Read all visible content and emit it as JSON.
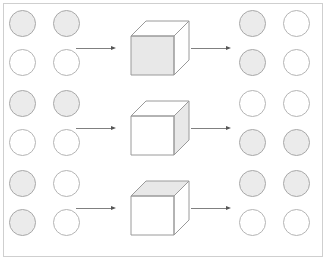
{
  "figure": {
    "type": "diagram",
    "canvas": {
      "width": 327,
      "height": 261,
      "background": "#ffffff"
    },
    "frame": {
      "border_color": "#cfcfcf",
      "border_width": 1
    },
    "colors": {
      "circle_outline": "#b4b4b4",
      "circle_shaded_fill": "#ebebeb",
      "circle_empty_fill": "#ffffff",
      "cube_edge": "#9a9a9a",
      "cube_shaded_face": "#e8e8e8",
      "cube_plain_face": "#ffffff",
      "arrow": "#808080"
    },
    "rows": [
      {
        "index": 1,
        "left_pattern_name": "top-row-shaded",
        "left_circles": [
          {
            "row": 0,
            "col": 0,
            "state": "shaded"
          },
          {
            "row": 0,
            "col": 1,
            "state": "shaded"
          },
          {
            "row": 1,
            "col": 0,
            "state": "empty"
          },
          {
            "row": 1,
            "col": 1,
            "state": "empty"
          }
        ],
        "cube": {
          "shaded_face": "front",
          "front_state": "shaded",
          "top_state": "plain",
          "side_state": "plain"
        },
        "right_pattern_name": "left-column-shaded",
        "right_circles": [
          {
            "row": 0,
            "col": 0,
            "state": "shaded"
          },
          {
            "row": 0,
            "col": 1,
            "state": "empty"
          },
          {
            "row": 1,
            "col": 0,
            "state": "shaded"
          },
          {
            "row": 1,
            "col": 1,
            "state": "empty"
          }
        ],
        "arrow_left": "arrow-right-icon",
        "arrow_right": "arrow-right-icon"
      },
      {
        "index": 2,
        "left_pattern_name": "top-row-shaded",
        "left_circles": [
          {
            "row": 0,
            "col": 0,
            "state": "shaded"
          },
          {
            "row": 0,
            "col": 1,
            "state": "shaded"
          },
          {
            "row": 1,
            "col": 0,
            "state": "empty"
          },
          {
            "row": 1,
            "col": 1,
            "state": "empty"
          }
        ],
        "cube": {
          "shaded_face": "side",
          "front_state": "plain",
          "top_state": "plain",
          "side_state": "shaded"
        },
        "right_pattern_name": "bottom-row-shaded",
        "right_circles": [
          {
            "row": 0,
            "col": 0,
            "state": "empty"
          },
          {
            "row": 0,
            "col": 1,
            "state": "empty"
          },
          {
            "row": 1,
            "col": 0,
            "state": "shaded"
          },
          {
            "row": 1,
            "col": 1,
            "state": "shaded"
          }
        ],
        "arrow_left": "arrow-right-icon",
        "arrow_right": "arrow-right-icon"
      },
      {
        "index": 3,
        "left_pattern_name": "left-column-shaded",
        "left_circles": [
          {
            "row": 0,
            "col": 0,
            "state": "shaded"
          },
          {
            "row": 0,
            "col": 1,
            "state": "empty"
          },
          {
            "row": 1,
            "col": 0,
            "state": "shaded"
          },
          {
            "row": 1,
            "col": 1,
            "state": "empty"
          }
        ],
        "cube": {
          "shaded_face": "top",
          "front_state": "plain",
          "top_state": "shaded",
          "side_state": "plain"
        },
        "right_pattern_name": "top-row-shaded",
        "right_circles": [
          {
            "row": 0,
            "col": 0,
            "state": "shaded"
          },
          {
            "row": 0,
            "col": 1,
            "state": "shaded"
          },
          {
            "row": 1,
            "col": 0,
            "state": "empty"
          },
          {
            "row": 1,
            "col": 1,
            "state": "empty"
          }
        ],
        "arrow_left": "arrow-right-icon",
        "arrow_right": "arrow-right-icon"
      }
    ]
  }
}
